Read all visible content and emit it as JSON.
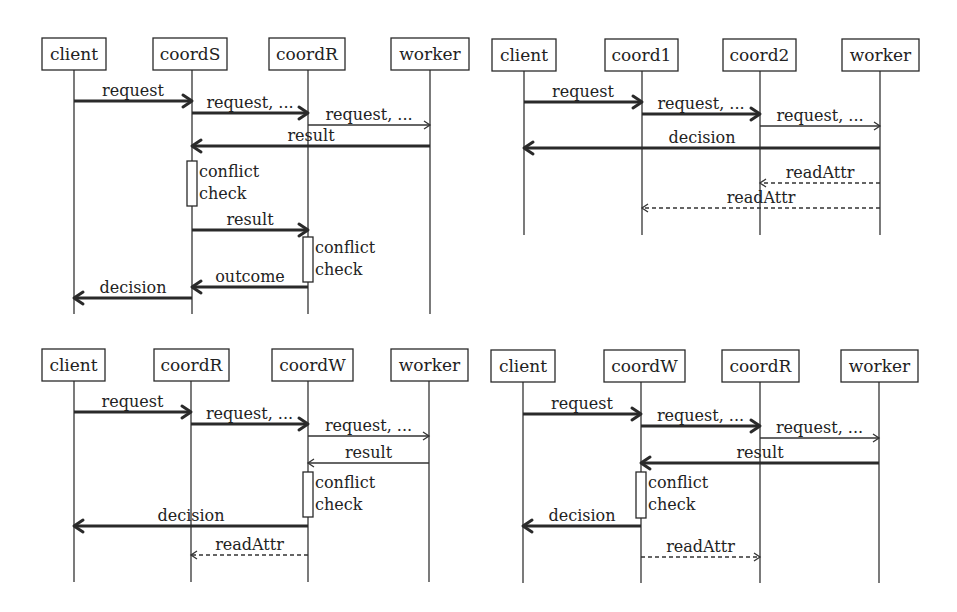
{
  "diagrams": [
    {
      "id": "top-left",
      "box_top": 38,
      "box_height": 32,
      "lifeline_end": 314,
      "participants": [
        {
          "name": "client",
          "x1": 42,
          "x2": 106,
          "life": 74
        },
        {
          "name": "coordS",
          "x1": 153,
          "x2": 227,
          "life": 192
        },
        {
          "name": "coordR",
          "x1": 269,
          "x2": 345,
          "life": 308
        },
        {
          "name": "worker",
          "x1": 391,
          "x2": 469,
          "life": 430
        }
      ],
      "messages": [
        {
          "label": "request",
          "from": 0,
          "to": 1,
          "y": 101,
          "style": "thick"
        },
        {
          "label": "request, ...",
          "from": 1,
          "to": 2,
          "y": 113,
          "style": "thick"
        },
        {
          "label": "request, ...",
          "from": 2,
          "to": 3,
          "y": 125,
          "style": "thin"
        },
        {
          "label": "result",
          "from": 3,
          "to": 1,
          "y": 146,
          "style": "thick"
        },
        {
          "label": "result",
          "from": 1,
          "to": 2,
          "y": 230,
          "style": "thick"
        },
        {
          "label": "outcome",
          "from": 2,
          "to": 1,
          "y": 287,
          "style": "thick"
        },
        {
          "label": "decision",
          "from": 1,
          "to": 0,
          "y": 298,
          "style": "thick"
        }
      ],
      "activations": [
        {
          "participant": 1,
          "y1": 161,
          "y2": 206,
          "lines": [
            "conflict",
            "check"
          ]
        },
        {
          "participant": 2,
          "y1": 237,
          "y2": 282,
          "lines": [
            "conflict",
            "check"
          ]
        }
      ]
    },
    {
      "id": "top-right",
      "box_top": 39,
      "box_height": 32,
      "lifeline_end": 235,
      "participants": [
        {
          "name": "client",
          "x1": 492,
          "x2": 556,
          "life": 524
        },
        {
          "name": "coord1",
          "x1": 605,
          "x2": 678,
          "life": 642
        },
        {
          "name": "coord2",
          "x1": 723,
          "x2": 796,
          "life": 760
        },
        {
          "name": "worker",
          "x1": 842,
          "x2": 919,
          "life": 880
        }
      ],
      "messages": [
        {
          "label": "request",
          "from": 0,
          "to": 1,
          "y": 102,
          "style": "thick"
        },
        {
          "label": "request, ...",
          "from": 1,
          "to": 2,
          "y": 114,
          "style": "thick"
        },
        {
          "label": "request, ...",
          "from": 2,
          "to": 3,
          "y": 126,
          "style": "thin"
        },
        {
          "label": "decision",
          "from": 3,
          "to": 0,
          "y": 148,
          "style": "thick"
        },
        {
          "label": "readAttr",
          "from": 3,
          "to": 2,
          "y": 183,
          "style": "dashed"
        },
        {
          "label": "readAttr",
          "from": 3,
          "to": 1,
          "y": 208,
          "style": "dashed"
        }
      ],
      "activations": []
    },
    {
      "id": "bottom-left",
      "box_top": 349,
      "box_height": 32,
      "lifeline_end": 582,
      "participants": [
        {
          "name": "client",
          "x1": 42,
          "x2": 105,
          "life": 74
        },
        {
          "name": "coordR",
          "x1": 154,
          "x2": 229,
          "life": 191
        },
        {
          "name": "coordW",
          "x1": 272,
          "x2": 353,
          "life": 308
        },
        {
          "name": "worker",
          "x1": 391,
          "x2": 468,
          "life": 429
        }
      ],
      "messages": [
        {
          "label": "request",
          "from": 0,
          "to": 1,
          "y": 412,
          "style": "thick"
        },
        {
          "label": "request, ...",
          "from": 1,
          "to": 2,
          "y": 424,
          "style": "thick"
        },
        {
          "label": "request, ...",
          "from": 2,
          "to": 3,
          "y": 436,
          "style": "thin"
        },
        {
          "label": "result",
          "from": 3,
          "to": 2,
          "y": 463,
          "style": "thin"
        },
        {
          "label": "decision",
          "from": 2,
          "to": 0,
          "y": 526,
          "style": "thick"
        },
        {
          "label": "readAttr",
          "from": 2,
          "to": 1,
          "y": 555,
          "style": "dashed"
        }
      ],
      "activations": [
        {
          "participant": 2,
          "y1": 472,
          "y2": 517,
          "lines": [
            "conflict",
            "check"
          ]
        }
      ]
    },
    {
      "id": "bottom-right",
      "box_top": 350,
      "box_height": 32,
      "lifeline_end": 583,
      "participants": [
        {
          "name": "client",
          "x1": 491,
          "x2": 555,
          "life": 523
        },
        {
          "name": "coordW",
          "x1": 604,
          "x2": 685,
          "life": 641
        },
        {
          "name": "coordR",
          "x1": 722,
          "x2": 799,
          "life": 760
        },
        {
          "name": "worker",
          "x1": 841,
          "x2": 918,
          "life": 879
        }
      ],
      "messages": [
        {
          "label": "request",
          "from": 0,
          "to": 1,
          "y": 414,
          "style": "thick"
        },
        {
          "label": "request, ...",
          "from": 1,
          "to": 2,
          "y": 426,
          "style": "thick"
        },
        {
          "label": "request, ...",
          "from": 2,
          "to": 3,
          "y": 438,
          "style": "thin"
        },
        {
          "label": "result",
          "from": 3,
          "to": 1,
          "y": 463,
          "style": "thick"
        },
        {
          "label": "decision",
          "from": 1,
          "to": 0,
          "y": 526,
          "style": "thick"
        },
        {
          "label": "readAttr",
          "from": 1,
          "to": 2,
          "y": 557,
          "style": "dashed"
        }
      ],
      "activations": [
        {
          "participant": 1,
          "y1": 472,
          "y2": 518,
          "lines": [
            "conflict",
            "check"
          ]
        }
      ]
    }
  ]
}
